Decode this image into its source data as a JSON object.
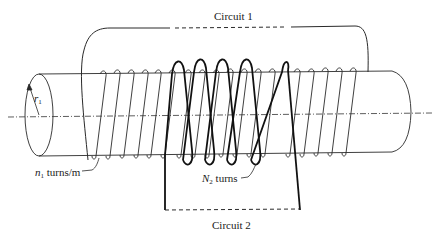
{
  "diagram": {
    "labels": {
      "circuit1": "Circuit 1",
      "circuit2": "Circuit 2",
      "radius_symbol": "r",
      "radius_sub": "1",
      "n1_symbol": "n",
      "n1_sub": "1",
      "n1_text": " turns/m",
      "n2_symbol": "N",
      "n2_sub": "2",
      "n2_text": " turns"
    },
    "colors": {
      "line": "#2a2a2a",
      "thick_coil": "#111111",
      "background": "#ffffff"
    },
    "components": {
      "cylinder": "long cylindrical core of radius r1",
      "primary_winding": "fine solenoid winding, n1 turns per meter, part of Circuit 1",
      "secondary_winding": "N2 turns of thick wire wound around primary, part of Circuit 2",
      "axis": "dash-dot center line of cylinder"
    }
  }
}
